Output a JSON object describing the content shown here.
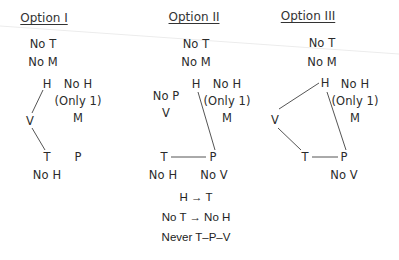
{
  "options": [
    {
      "title": "Option I",
      "constraints": [
        "No T",
        "No M"
      ],
      "nodes": {
        "H": "H",
        "V": "V",
        "T": "T",
        "P": "P"
      },
      "side_notes": [
        "No H",
        "(Only 1)",
        "M"
      ],
      "under_T": "No H",
      "edges": [
        [
          "H",
          "V"
        ],
        [
          "V",
          "T"
        ]
      ]
    },
    {
      "title": "Option II",
      "constraints": [
        "No T",
        "No M"
      ],
      "nodes": {
        "H": "H",
        "T": "T",
        "P": "P"
      },
      "left_notes": [
        "No P",
        "V"
      ],
      "side_notes": [
        "No H",
        "(Only 1)",
        "M"
      ],
      "under_T": "No H",
      "under_P": "No V",
      "edges": [
        [
          "H",
          "P"
        ],
        [
          "T",
          "P"
        ]
      ],
      "rules": [
        "H → T",
        "No T → No H",
        "Never T–P–V"
      ]
    },
    {
      "title": "Option III",
      "constraints": [
        "No T",
        "No M"
      ],
      "nodes": {
        "H": "H",
        "V": "V",
        "T": "T",
        "P": "P"
      },
      "side_notes": [
        "No H",
        "(Only 1)",
        "M"
      ],
      "under_P": "No V",
      "edges": [
        [
          "H",
          "V"
        ],
        [
          "V",
          "T"
        ],
        [
          "T",
          "P"
        ],
        [
          "H",
          "P"
        ]
      ]
    }
  ],
  "colors": {
    "text": "#2b2b2b",
    "line": "#555555",
    "background": "#ffffff",
    "fold_line": "#e6e6e6"
  }
}
